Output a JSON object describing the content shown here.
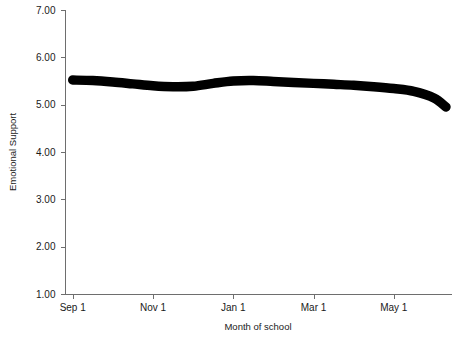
{
  "chart_data": {
    "type": "line",
    "title": "",
    "xlabel": "Month of school",
    "ylabel": "Emotional Support",
    "grid": false,
    "legend": "none",
    "ylim": [
      1.0,
      7.0
    ],
    "ytick_labels": [
      "7.00",
      "6.00",
      "5.00",
      "4.00",
      "3.00",
      "2.00",
      "1.00"
    ],
    "ytick_values": [
      7.0,
      6.0,
      5.0,
      4.0,
      3.0,
      2.0,
      1.0
    ],
    "xtick_labels": [
      "Sep 1",
      "Nov 1",
      "Jan 1",
      "Mar 1",
      "May 1"
    ],
    "xtick_months": [
      0,
      2,
      4,
      6,
      8
    ],
    "xlim_months": [
      -0.18,
      9.45
    ],
    "line_color": "#000000",
    "line_width_units": 0.2,
    "series": [
      {
        "name": "Emotional Support",
        "x_months": [
          0.0,
          0.5,
          1.0,
          1.5,
          2.0,
          2.5,
          3.0,
          3.5,
          4.0,
          4.5,
          5.0,
          5.5,
          6.0,
          6.5,
          7.0,
          7.5,
          8.0,
          8.5,
          9.0,
          9.3
        ],
        "values": [
          5.52,
          5.51,
          5.48,
          5.44,
          5.4,
          5.38,
          5.39,
          5.45,
          5.5,
          5.51,
          5.49,
          5.47,
          5.45,
          5.43,
          5.41,
          5.38,
          5.34,
          5.28,
          5.14,
          4.95
        ]
      }
    ]
  },
  "axes": {
    "y_axis_name": "emotional-support-axis",
    "x_axis_name": "month-of-school-axis"
  }
}
